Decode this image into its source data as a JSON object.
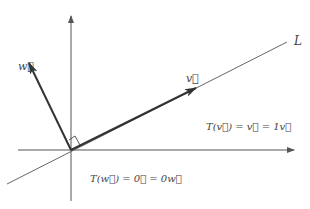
{
  "diagram": {
    "colors": {
      "axis": "#555555",
      "line": "#666666",
      "vector": "#333333",
      "text": "#444444",
      "background": "#ffffff"
    },
    "axes": {
      "origin": [
        71,
        150
      ],
      "x_axis": {
        "from": [
          18,
          150
        ],
        "to": [
          294,
          150
        ]
      },
      "y_axis": {
        "from": [
          71,
          201
        ],
        "to": [
          71,
          16
        ]
      }
    },
    "line_L": {
      "from": [
        7,
        184
      ],
      "to": [
        287,
        42
      ],
      "label": "L",
      "label_pos": [
        294,
        45
      ]
    },
    "vectors": [
      {
        "name": "v",
        "from": [
          71,
          150
        ],
        "to": [
          196,
          88
        ],
        "label": "v⃗",
        "label_pos": [
          186,
          82
        ]
      },
      {
        "name": "w",
        "from": [
          71,
          150
        ],
        "to": [
          29,
          63
        ],
        "label": "w⃗",
        "label_pos": [
          18,
          70
        ]
      }
    ],
    "right_angle_marker": {
      "points": [
        [
          69,
          140
        ],
        [
          75,
          136
        ],
        [
          80,
          145
        ]
      ]
    },
    "equations": [
      {
        "name": "eq-v",
        "text": "T(v⃗) = v⃗ = 1v⃗",
        "pos": [
          206,
          130
        ]
      },
      {
        "name": "eq-w",
        "text": "T(w⃗) = 0⃗ = 0w⃗",
        "pos": [
          90,
          182
        ]
      }
    ]
  }
}
